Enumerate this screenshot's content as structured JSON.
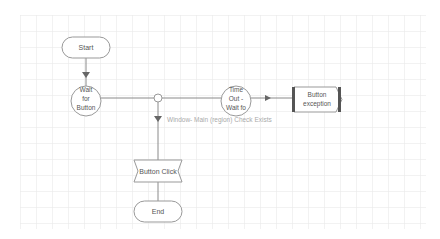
{
  "diagram": {
    "type": "flowchart",
    "colors": {
      "background": "#ffffff",
      "grid": "#e6e6e6",
      "stroke": "#8a8a8a",
      "text": "#555555",
      "label_text": "#aaaaaa",
      "exception_bar": "#555555"
    },
    "nodes": [
      {
        "id": "start",
        "shape": "terminator",
        "label": "Start"
      },
      {
        "id": "wait",
        "shape": "circle",
        "label_lines": [
          "Wait",
          "for",
          "Button"
        ]
      },
      {
        "id": "junction",
        "shape": "connector",
        "label": ""
      },
      {
        "id": "timeout",
        "shape": "circle",
        "label_lines": [
          "Time",
          "Out -",
          "Wait fo"
        ]
      },
      {
        "id": "exception",
        "shape": "exception",
        "label_lines": [
          "Button",
          "exception"
        ]
      },
      {
        "id": "click",
        "shape": "action",
        "label": "Button Click"
      },
      {
        "id": "end",
        "shape": "terminator",
        "label": "End"
      }
    ],
    "edges": [
      {
        "from": "start",
        "to": "wait",
        "label": ""
      },
      {
        "from": "wait",
        "to": "junction",
        "label": ""
      },
      {
        "from": "junction",
        "to": "timeout",
        "label": ""
      },
      {
        "from": "timeout",
        "to": "exception",
        "label": ""
      },
      {
        "from": "junction",
        "to": "click",
        "label": "Window- Main (region) Check Exists"
      },
      {
        "from": "click",
        "to": "end",
        "label": ""
      }
    ]
  }
}
